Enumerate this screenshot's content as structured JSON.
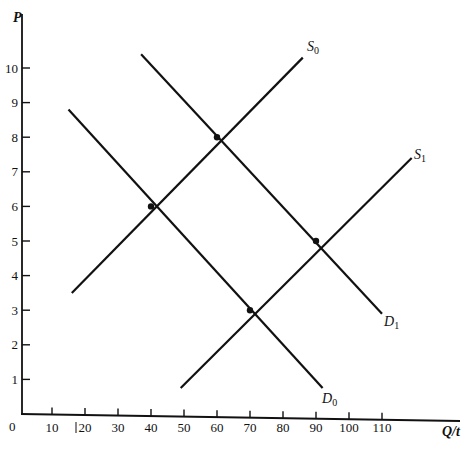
{
  "chart_data": {
    "type": "line",
    "title": "",
    "xlabel": "Q/t",
    "ylabel": "P",
    "xlim": [
      0,
      120
    ],
    "ylim": [
      0,
      11
    ],
    "grid": false,
    "legend": "none (curves labeled at line ends)",
    "x_ticks": [
      10,
      20,
      30,
      40,
      50,
      60,
      70,
      80,
      90,
      100,
      110
    ],
    "y_ticks": [
      1,
      2,
      3,
      4,
      5,
      6,
      7,
      8,
      9,
      10
    ],
    "origin_label": "0",
    "series": [
      {
        "name": "D0",
        "label_main": "D",
        "label_sub": "0",
        "kind": "demand",
        "points": [
          [
            15,
            8.8
          ],
          [
            92,
            0.75
          ]
        ]
      },
      {
        "name": "D1",
        "label_main": "D",
        "label_sub": "1",
        "kind": "demand",
        "points": [
          [
            37,
            10.4
          ],
          [
            110,
            2.9
          ]
        ]
      },
      {
        "name": "S0",
        "label_main": "S",
        "label_sub": "0",
        "kind": "supply",
        "points": [
          [
            16,
            3.5
          ],
          [
            86,
            10.3
          ]
        ]
      },
      {
        "name": "S1",
        "label_main": "S",
        "label_sub": "1",
        "kind": "supply",
        "points": [
          [
            49,
            0.75
          ],
          [
            119,
            7.4
          ]
        ]
      }
    ],
    "equilibria": [
      {
        "curves": [
          "S0",
          "D0"
        ],
        "x": 40,
        "y": 6
      },
      {
        "curves": [
          "S0",
          "D1"
        ],
        "x": 60,
        "y": 8
      },
      {
        "curves": [
          "S1",
          "D0"
        ],
        "x": 70,
        "y": 3
      },
      {
        "curves": [
          "S1",
          "D1"
        ],
        "x": 90,
        "y": 5
      }
    ],
    "annotations": [
      "stray mark '|' before x tick label 20"
    ]
  },
  "colors": {
    "ink": "#111111",
    "background": "#ffffff"
  }
}
